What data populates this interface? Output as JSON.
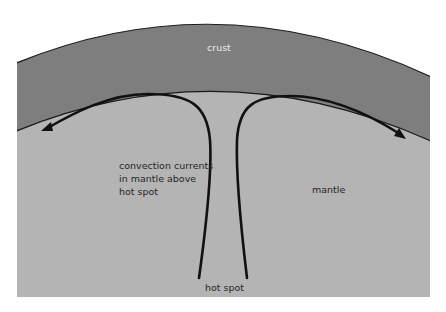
{
  "diagram": {
    "title": "Convection currents in mantle above hot spot",
    "labels": {
      "crust": "crust",
      "convection": "convection currents\nin mantle above\nhot spot",
      "mantle": "mantle",
      "hot_spot": "hot spot"
    },
    "colors": {
      "background": "#ffffff",
      "crust_fill": "#7e7e7e",
      "mantle_fill": "#b4b4b4",
      "outline": "#1a1a1a",
      "arrow": "#111111",
      "crust_label": "#ececec",
      "text": "#262626"
    },
    "arrows": [
      {
        "name": "left-convection-arrow",
        "direction": "left-down"
      },
      {
        "name": "right-convection-arrow",
        "direction": "right-down"
      }
    ]
  }
}
